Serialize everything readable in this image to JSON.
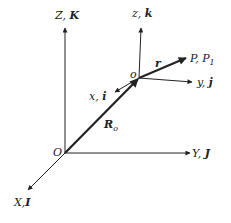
{
  "diagram": {
    "type": "coordinate-frames",
    "global_frame": {
      "origin_label": "O",
      "axes": [
        {
          "name": "Z",
          "unit": "K",
          "label": "Z, K"
        },
        {
          "name": "Y",
          "unit": "J",
          "label": "Y, J"
        },
        {
          "name": "X",
          "unit": "I",
          "label": "X, I"
        }
      ]
    },
    "local_frame": {
      "origin_label": "o",
      "axes": [
        {
          "name": "z",
          "unit": "k",
          "label": "z, k"
        },
        {
          "name": "y",
          "unit": "j",
          "label": "y, j"
        },
        {
          "name": "x",
          "unit": "i",
          "label": "x, i"
        }
      ]
    },
    "vectors": [
      {
        "name": "R_o",
        "label_main": "R",
        "label_sub": "o",
        "from": "O",
        "to": "o"
      },
      {
        "name": "r",
        "label_main": "r",
        "from": "o",
        "to": "P"
      }
    ],
    "point": {
      "label_main": "P, P",
      "label_sub": "1"
    },
    "colors": {
      "stroke": "#222222",
      "background": "#ffffff"
    }
  }
}
